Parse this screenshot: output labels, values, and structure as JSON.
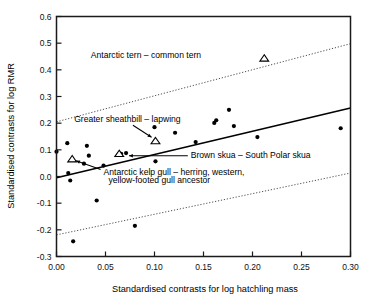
{
  "chart_data": {
    "type": "scatter",
    "title": "",
    "xlabel": "Standardised contrasts for log hatchling mass",
    "ylabel": "Standardised contrasts for log RMR",
    "xlim": [
      0.0,
      0.3
    ],
    "ylim": [
      -0.3,
      0.6
    ],
    "xticks": [
      "0.00",
      "0.05",
      "0.10",
      "0.15",
      "0.20",
      "0.25",
      "0.30"
    ],
    "xtick_values": [
      0.0,
      0.05,
      0.1,
      0.15,
      0.2,
      0.25,
      0.3
    ],
    "yticks": [
      "0.6",
      "0.5",
      "0.4",
      "0.3",
      "0.2",
      "0.1",
      "0.0",
      "-0.1",
      "-0.2",
      "-0.3"
    ],
    "ytick_values": [
      0.6,
      0.5,
      0.4,
      0.3,
      0.2,
      0.1,
      0.0,
      -0.1,
      -0.2,
      -0.3
    ],
    "grid": false,
    "legend": "none",
    "marker_color": "#000000",
    "line_color": "#000000",
    "series": [
      {
        "name": "contrasts",
        "marker": "filled-circle",
        "points": [
          {
            "x": 0.0,
            "y": 0.093
          },
          {
            "x": 0.011,
            "y": 0.125
          },
          {
            "x": 0.012,
            "y": 0.013
          },
          {
            "x": 0.014,
            "y": -0.015
          },
          {
            "x": 0.017,
            "y": -0.243
          },
          {
            "x": 0.028,
            "y": 0.048
          },
          {
            "x": 0.031,
            "y": 0.115
          },
          {
            "x": 0.033,
            "y": 0.078
          },
          {
            "x": 0.041,
            "y": -0.09
          },
          {
            "x": 0.048,
            "y": 0.041
          },
          {
            "x": 0.066,
            "y": 0.085
          },
          {
            "x": 0.071,
            "y": 0.088
          },
          {
            "x": 0.08,
            "y": -0.185
          },
          {
            "x": 0.1,
            "y": 0.185
          },
          {
            "x": 0.101,
            "y": 0.057
          },
          {
            "x": 0.121,
            "y": 0.164
          },
          {
            "x": 0.142,
            "y": 0.129
          },
          {
            "x": 0.161,
            "y": 0.201
          },
          {
            "x": 0.163,
            "y": 0.211
          },
          {
            "x": 0.176,
            "y": 0.25
          },
          {
            "x": 0.181,
            "y": 0.189
          },
          {
            "x": 0.205,
            "y": 0.148
          },
          {
            "x": 0.29,
            "y": 0.181
          }
        ]
      },
      {
        "name": "highlighted contrasts",
        "marker": "open-triangle",
        "points": [
          {
            "x": 0.016,
            "y": 0.065,
            "label": "Antarctic kelp gull – herring, western, yellow-footed gull ancestor"
          },
          {
            "x": 0.064,
            "y": 0.085,
            "label": "Brown skua – South Polar skua"
          },
          {
            "x": 0.101,
            "y": 0.133,
            "label": "Greater sheathbill – lapwing"
          },
          {
            "x": 0.212,
            "y": 0.443,
            "label": "Antarctic tern – common tern"
          }
        ]
      }
    ],
    "fit_line": {
      "name": "regression-line",
      "style": "solid",
      "x0": 0.0,
      "y0": -0.005,
      "x1": 0.3,
      "y1": 0.257
    },
    "confidence_bands": [
      {
        "name": "upper-confidence-band",
        "style": "dotted",
        "x0": 0.0,
        "y0": 0.205,
        "x1": 0.3,
        "y1": 0.498
      },
      {
        "name": "lower-confidence-band",
        "style": "dotted",
        "x0": 0.0,
        "y0": -0.219,
        "x1": 0.3,
        "y1": 0.013
      }
    ],
    "annotations": [
      {
        "id": "antarctic-tern",
        "text": "Antarctic tern – common tern",
        "text_x": 0.035,
        "text_y": 0.455,
        "anchor": "start",
        "arrow": false
      },
      {
        "id": "greater-sheathbill",
        "text": "Greater sheathbill – lapwing",
        "text_x": 0.018,
        "text_y": 0.214,
        "anchor": "start",
        "arrow": true,
        "arrow_x0": 0.078,
        "arrow_y0": 0.192,
        "arrow_x1": 0.097,
        "arrow_y1": 0.147
      },
      {
        "id": "brown-skua",
        "text": "Brown skua – South Polar skua",
        "text_x": 0.137,
        "text_y": 0.081,
        "anchor": "start",
        "arrow": true,
        "arrow_x0": 0.134,
        "arrow_y0": 0.078,
        "arrow_x1": 0.074,
        "arrow_y1": 0.078
      },
      {
        "id": "antarctic-kelp-gull-line1",
        "text": "Antarctic kelp gull – herring, western,",
        "text_x": 0.048,
        "text_y": 0.018,
        "anchor": "start",
        "arrow": true,
        "arrow_x0": 0.045,
        "arrow_y0": 0.026,
        "arrow_x1": 0.02,
        "arrow_y1": 0.059
      },
      {
        "id": "antarctic-kelp-gull-line2",
        "text": "yellow-footed gull ancestor",
        "text_x": 0.053,
        "text_y": -0.012,
        "anchor": "start",
        "arrow": false
      }
    ]
  }
}
